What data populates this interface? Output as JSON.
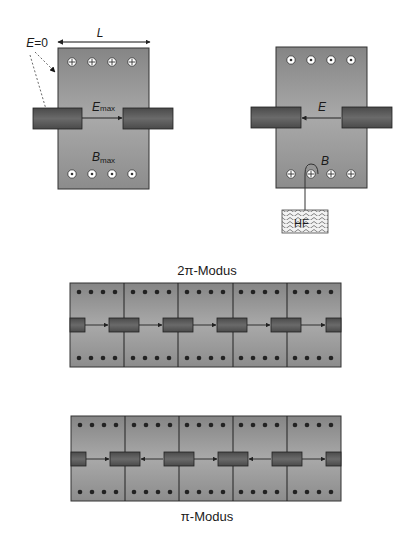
{
  "colors": {
    "cavity_fill_top": "#8a8a8a",
    "cavity_fill_mid": "#a8a8a8",
    "drift_tube": "#555555",
    "outline": "#222222",
    "background": "#ffffff"
  },
  "single_cavity_left": {
    "label_L": "L",
    "label_E0": "E=0",
    "label_Emax_main": "E",
    "label_Emax_sub": "max",
    "label_Bmax_main": "B",
    "label_Bmax_sub": "max",
    "top_symbols": "crossed (into page)",
    "bottom_symbols": "dotted (out of page)"
  },
  "single_cavity_right": {
    "label_E": "E",
    "label_B": "B",
    "hf_label": "HF",
    "top_symbols": "dotted (out of page)",
    "bottom_symbols": "crossed (into page)"
  },
  "structure_2pi": {
    "title": "2π-Modus",
    "cells": 5,
    "field_directions": [
      "right",
      "right",
      "right",
      "right",
      "right"
    ]
  },
  "structure_pi": {
    "title": "π-Modus",
    "cells": 5,
    "field_directions": [
      "right",
      "left",
      "right",
      "left",
      "right"
    ]
  }
}
